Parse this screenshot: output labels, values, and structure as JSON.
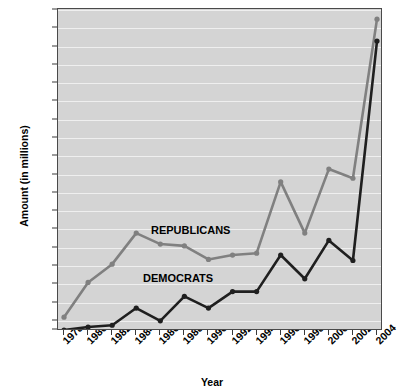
{
  "chart_data": {
    "type": "line",
    "title": "",
    "xlabel": "Year",
    "ylabel": "Amount (in millions)",
    "x": [
      1978,
      1980,
      1982,
      1984,
      1986,
      1988,
      1990,
      1992,
      1994,
      1996,
      1998,
      2000,
      2002,
      2004
    ],
    "xtick_labels": [
      "1978",
      "1980",
      "1982",
      "1984",
      "1986",
      "1988",
      "1990",
      "1992",
      "1994",
      "1996",
      "1998",
      "2000",
      "2002",
      "2004"
    ],
    "ytick_labels": [
      "$25",
      "$50",
      "$100",
      "$150",
      "$200",
      "$250",
      "$300",
      "$350",
      "$400",
      "$450",
      "$500",
      "$550",
      "$600",
      "$650",
      "$700",
      "$750",
      "$800",
      "$850",
      "$900"
    ],
    "ytick_values": [
      25,
      50,
      100,
      150,
      200,
      250,
      300,
      350,
      400,
      450,
      500,
      550,
      600,
      650,
      700,
      750,
      800,
      850,
      900
    ],
    "ylim": [
      25,
      900
    ],
    "grid": true,
    "legend_position": "inline",
    "series": [
      {
        "name": "REPUBLICANS",
        "color": "#808080",
        "values": [
          60,
          155,
          205,
          290,
          260,
          255,
          218,
          230,
          235,
          430,
          290,
          465,
          440,
          875
        ]
      },
      {
        "name": "DEMOCRATS",
        "color": "#1f1f1f",
        "values": [
          25,
          33,
          38,
          85,
          50,
          117,
          85,
          130,
          130,
          230,
          165,
          270,
          215,
          815
        ]
      }
    ],
    "annotations": [
      {
        "text": "REPUBLICANS"
      },
      {
        "text": "DEMOCRATS"
      }
    ]
  },
  "colors": {
    "plot_background": "#d4d4d4",
    "gridline": "#efefef",
    "axis": "#4a4a4a",
    "republicans": "#808080",
    "democrats": "#1f1f1f"
  }
}
